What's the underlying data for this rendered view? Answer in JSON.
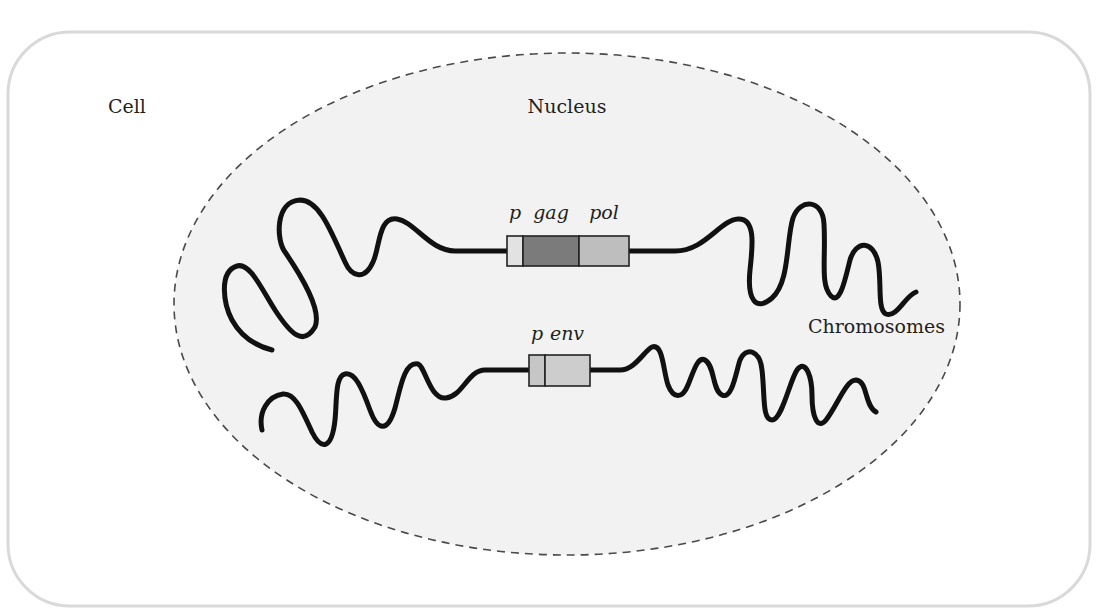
{
  "figure": {
    "labels": {
      "cell": "Cell",
      "nucleus": "Nucleus",
      "chromosomes": "Chromosomes"
    },
    "upper_chromosome": {
      "genes": [
        {
          "name": "p",
          "label": "p",
          "color": "#e2e2e2"
        },
        {
          "name": "gag",
          "label": "gag",
          "color": "#7b7b7b"
        },
        {
          "name": "pol",
          "label": "pol",
          "color": "#bebebe"
        }
      ]
    },
    "lower_chromosome": {
      "genes": [
        {
          "name": "p",
          "label": "p",
          "color": "#c6c6c6"
        },
        {
          "name": "env",
          "label": "env",
          "color": "#cdcdcd"
        }
      ]
    },
    "colors": {
      "cell_border": "#d9d9d9",
      "nucleus_fill": "#f2f2f2",
      "nucleus_border": "#4a4a4a",
      "chromosome": "#111111"
    }
  }
}
